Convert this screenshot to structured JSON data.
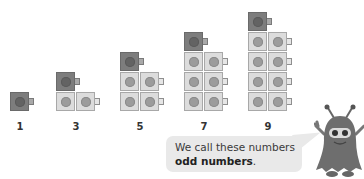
{
  "scene": {
    "columns": [
      {
        "value": 1,
        "label": "1",
        "pairs": 0
      },
      {
        "value": 3,
        "label": "3",
        "pairs": 1
      },
      {
        "value": 5,
        "label": "5",
        "pairs": 2
      },
      {
        "value": 7,
        "label": "7",
        "pairs": 3
      },
      {
        "value": 9,
        "label": "9",
        "pairs": 4
      }
    ],
    "bubble": {
      "line1": "We call these numbers",
      "bold": "odd numbers",
      "end": "."
    },
    "colors": {
      "dark_cube": "#7d7d7d",
      "light_cube": "#dcdcdc",
      "bubble_bg": "#e9e9e9",
      "monster": "#6e6e6e"
    },
    "icons": [
      "linking-cube-icon",
      "monster-character-icon"
    ]
  }
}
